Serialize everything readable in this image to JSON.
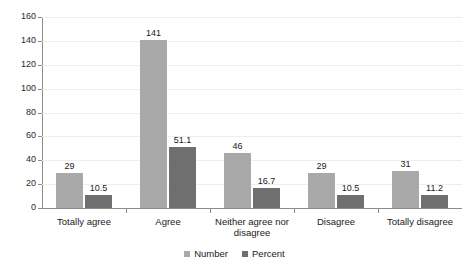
{
  "chart_data": {
    "type": "bar",
    "title": "",
    "xlabel": "",
    "ylabel": "",
    "ylim": [
      0,
      160
    ],
    "y_ticks": [
      0,
      20,
      40,
      60,
      80,
      100,
      120,
      140,
      160
    ],
    "grid": true,
    "legend_position": "bottom",
    "categories": [
      "Totally agree",
      "Agree",
      "Neither agree nor disagree",
      "Disagree",
      "Totally disagree"
    ],
    "series": [
      {
        "name": "Number",
        "color": "#a9a9a9",
        "values": [
          29,
          141,
          46,
          29,
          31
        ],
        "labels": [
          "29",
          "141",
          "46",
          "29",
          "31"
        ]
      },
      {
        "name": "Percent",
        "color": "#6f6f6f",
        "values": [
          10.5,
          51.1,
          16.7,
          10.5,
          11.2
        ],
        "labels": [
          "10.5",
          "51.1",
          "16.7",
          "10.5",
          "11.2"
        ]
      }
    ]
  },
  "axis": {
    "y_tick_labels": [
      "160",
      "140",
      "120",
      "100",
      "80",
      "60",
      "40",
      "20",
      "0"
    ]
  },
  "category_labels": [
    "Totally agree",
    "Agree",
    "Neither agree nor\ndisagree",
    "Disagree",
    "Totally disagree"
  ],
  "legend": {
    "items": [
      {
        "label": "Number",
        "color": "#a9a9a9"
      },
      {
        "label": "Percent",
        "color": "#6f6f6f"
      }
    ]
  }
}
